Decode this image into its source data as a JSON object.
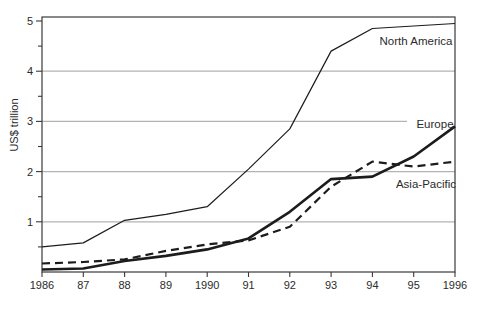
{
  "figure": {
    "background": "#ffffff",
    "ylabel": "US$ trillion"
  },
  "chart_data": {
    "type": "line",
    "title": "",
    "xlabel": "",
    "ylabel": "US$ trillion",
    "x": [
      1986,
      1987,
      1988,
      1989,
      1990,
      1991,
      1992,
      1993,
      1994,
      1995,
      1996
    ],
    "x_tick_labels": [
      "1986",
      "87",
      "88",
      "89",
      "1990",
      "91",
      "92",
      "93",
      "94",
      "95",
      "1996"
    ],
    "y_tick_labels": [
      "1",
      "2",
      "3",
      "4",
      "5"
    ],
    "ylim": [
      0,
      5
    ],
    "y_major_step": 1,
    "y_minor_step": 0.5,
    "grid": "horizontal-major",
    "legend_position": "inline-annotations",
    "series": [
      {
        "name": "North America",
        "style": "thin-solid",
        "values": [
          0.5,
          0.58,
          1.03,
          1.15,
          1.3,
          2.05,
          2.85,
          4.4,
          4.85,
          4.9,
          4.95
        ]
      },
      {
        "name": "Europe",
        "style": "thick-solid",
        "values": [
          0.05,
          0.07,
          0.22,
          0.32,
          0.45,
          0.67,
          1.2,
          1.85,
          1.9,
          2.3,
          2.9
        ]
      },
      {
        "name": "Asia-Pacific",
        "style": "thick-dashed",
        "values": [
          0.17,
          0.2,
          0.25,
          0.42,
          0.55,
          0.63,
          0.9,
          1.7,
          2.2,
          2.1,
          2.2
        ]
      }
    ],
    "annotations": [
      {
        "text": "North America",
        "px": 416,
        "py": 41
      },
      {
        "text": "Europe",
        "px": 435,
        "py": 124
      },
      {
        "text": "Asia-Pacific",
        "px": 426,
        "py": 184
      }
    ],
    "grid_gap": {
      "value": 3,
      "end_px": 407
    },
    "colors": {
      "line": "#1c1c1c",
      "grid": "#b3b3b3",
      "frame": "#3a3a3a",
      "text": "#2b2b2b"
    }
  }
}
